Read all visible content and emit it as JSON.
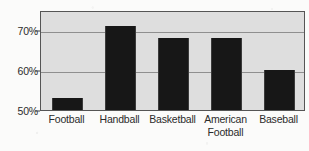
{
  "chart_data": {
    "type": "bar",
    "title": "",
    "subtitle": "",
    "xlabel": "",
    "ylabel": "",
    "categories": [
      "Football",
      "Handball",
      "Basketball",
      "American\nFootball",
      "Baseball"
    ],
    "values": [
      53,
      71,
      68,
      68,
      60
    ],
    "ylim": [
      50,
      75
    ],
    "ytick_labels": [
      "50%",
      "60%",
      "70%"
    ],
    "ytick_values": [
      50,
      60,
      70
    ],
    "gridlines": [
      60,
      70
    ],
    "grid": true,
    "legend": null,
    "legend_position": "none",
    "annotations": [],
    "colors": {
      "bar_fill": "#171717",
      "plot_background": "#dedede",
      "gridline": "#8f8f8f",
      "axis": "#555555",
      "text": "#2b2b2b",
      "page_background": "#fbfbfa"
    }
  }
}
